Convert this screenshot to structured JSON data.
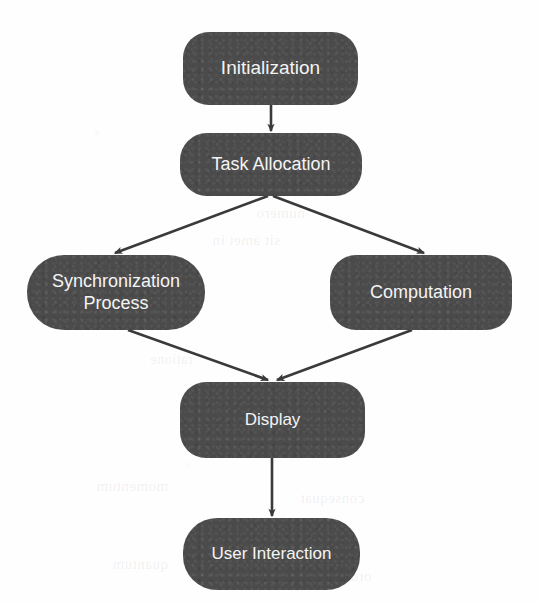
{
  "diagram": {
    "type": "flowchart",
    "background_color": "#fefefe",
    "node_fill_color": "#4b4b4b",
    "node_text_color": "#f4f4f4",
    "edge_color": "#3a3a3a",
    "nodes": [
      {
        "id": "initialization",
        "label": "Initialization"
      },
      {
        "id": "task_allocation",
        "label": "Task Allocation"
      },
      {
        "id": "synchronization",
        "label": "Synchronization\nProcess"
      },
      {
        "id": "computation",
        "label": "Computation"
      },
      {
        "id": "display",
        "label": "Display"
      },
      {
        "id": "user_interaction",
        "label": "User Interaction"
      }
    ],
    "edges": [
      {
        "from": "Initialization",
        "to": "Task Allocation",
        "style": "vertical-arrow"
      },
      {
        "from": "Task Allocation",
        "to": "Synchronization Process",
        "style": "diagonal-arrow"
      },
      {
        "from": "Task Allocation",
        "to": "Computation",
        "style": "diagonal-arrow"
      },
      {
        "from": "Synchronization Process",
        "to": "Display",
        "style": "diagonal-arrow"
      },
      {
        "from": "Computation",
        "to": "Display",
        "style": "diagonal-arrow"
      },
      {
        "from": "Display",
        "to": "User Interaction",
        "style": "vertical-arrow"
      }
    ],
    "bleed_through": [
      {
        "text": "aqua nopalis",
        "x": 198,
        "y": 148,
        "size": 15
      },
      {
        "text": "ter reliquis",
        "x": 228,
        "y": 176,
        "size": 15
      },
      {
        "text": "numero",
        "x": 256,
        "y": 205,
        "size": 15
      },
      {
        "text": "sit amet in",
        "x": 212,
        "y": 232,
        "size": 15
      },
      {
        "text": "ratione",
        "x": 150,
        "y": 352,
        "size": 14
      },
      {
        "text": "momentum",
        "x": 96,
        "y": 478,
        "size": 15
      },
      {
        "text": "quantum",
        "x": 112,
        "y": 556,
        "size": 15
      },
      {
        "text": "consequat",
        "x": 300,
        "y": 490,
        "size": 15
      },
      {
        "text": "ordinem",
        "x": 318,
        "y": 568,
        "size": 15
      }
    ]
  }
}
